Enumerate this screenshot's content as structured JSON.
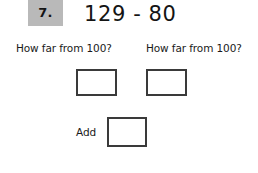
{
  "problem": {
    "number_label": "7.",
    "equation": "129 - 80",
    "badge_color": "#b9b9b9",
    "box_border_color": "#3a3a3a",
    "background_color": "#ffffff",
    "text_color": "#1a1a1a"
  },
  "prompts": {
    "left": "How far from 100?",
    "right": "How far from 100?"
  },
  "answers": {
    "left_value": "",
    "right_value": "",
    "add_value": ""
  },
  "add_row": {
    "label": "Add"
  }
}
